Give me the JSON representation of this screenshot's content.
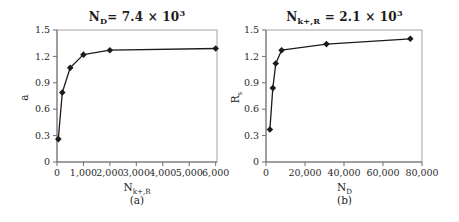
{
  "figure": {
    "background": "#ffffff",
    "text_color": "#242424",
    "axis_color": "#6e6e6e",
    "frame_color": "#a3a3a3",
    "line_color": "#1b1b1b"
  },
  "chart_data": [
    {
      "id": "a",
      "type": "line",
      "marker": "diamond",
      "title": {
        "base": "N",
        "sub": "D",
        "mid": "= 7.4 × 10",
        "sup": "3"
      },
      "xlabel": {
        "base": "N",
        "sub": "k+,R"
      },
      "ylabel": {
        "base": "a",
        "sub": ""
      },
      "caption": "(a)",
      "x": [
        50,
        200,
        500,
        1000,
        2000,
        6000
      ],
      "y": [
        0.26,
        0.79,
        1.07,
        1.22,
        1.27,
        1.29
      ],
      "xlim": [
        0,
        6050
      ],
      "ylim": [
        0,
        1.5
      ],
      "xticks": [
        0,
        1000,
        2000,
        3000,
        4000,
        5000,
        6000
      ],
      "xtick_labels": [
        "0",
        "1,000",
        "2,000",
        "3,000",
        "4,000",
        "5,000",
        "6,000"
      ],
      "yticks": [
        0,
        0.3,
        0.6,
        0.9,
        1.2,
        1.5
      ],
      "ytick_labels": [
        "0",
        "0.3",
        "0.6",
        "0.9",
        "1.2",
        "1.5"
      ],
      "grid": false,
      "legend": "none"
    },
    {
      "id": "b",
      "type": "line",
      "marker": "diamond",
      "title": {
        "base": "N",
        "sub": "k+,R",
        "mid": " = 2.1 × 10",
        "sup": "3"
      },
      "xlabel": {
        "base": "N",
        "sub": "D"
      },
      "ylabel": {
        "base": "R",
        "sub": "s"
      },
      "caption": "(b)",
      "x": [
        2000,
        3500,
        5000,
        8000,
        31000,
        74000
      ],
      "y": [
        0.37,
        0.84,
        1.12,
        1.27,
        1.34,
        1.4
      ],
      "xlim": [
        0,
        80000
      ],
      "ylim": [
        0,
        1.5
      ],
      "xticks": [
        0,
        20000,
        40000,
        60000,
        80000
      ],
      "xtick_labels": [
        "0",
        "20,000",
        "40,000",
        "60,000",
        "80,000"
      ],
      "yticks": [
        0,
        0.3,
        0.6,
        0.9,
        1.2,
        1.5
      ],
      "ytick_labels": [
        "0",
        "0.3",
        "0.6",
        "0.9",
        "1.2",
        "1.5"
      ],
      "grid": false,
      "legend": "none"
    }
  ]
}
